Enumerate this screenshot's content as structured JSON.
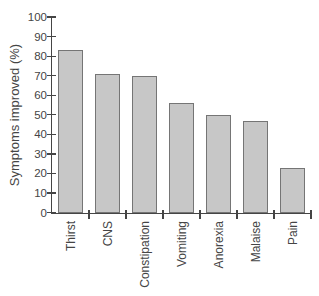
{
  "figure": {
    "background": "#ffffff",
    "axis_color": "#454545",
    "text_color": "#454545",
    "bar_fill": "#c7c7c7",
    "bar_border": "#757575"
  },
  "chart_data": {
    "type": "bar",
    "title": "",
    "xlabel": "",
    "ylabel": "Symptoms improved (%)",
    "categories": [
      "Thirst",
      "CNS",
      "Constipation",
      "Vomiting",
      "Anorexia",
      "Malaise",
      "Pain"
    ],
    "values": [
      83,
      71,
      70,
      56,
      50,
      47,
      23
    ],
    "ylim": [
      0,
      100
    ],
    "yticks": [
      0,
      10,
      20,
      30,
      40,
      50,
      60,
      70,
      80,
      90,
      100
    ],
    "grid": false,
    "legend_position": "none"
  }
}
